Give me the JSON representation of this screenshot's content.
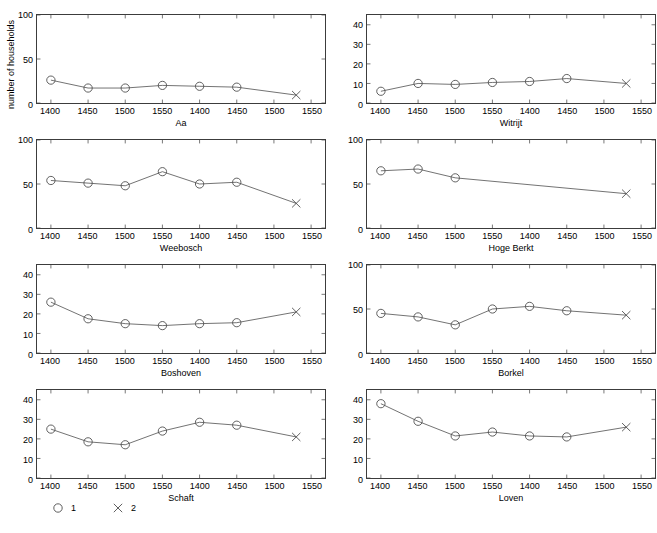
{
  "figure": {
    "ylabel": "number of households",
    "caption_partial": ""
  },
  "legend": {
    "position": "bottom-left",
    "entries": [
      {
        "label": "1",
        "marker": "circle",
        "marker_icon": "circle-marker-icon"
      },
      {
        "label": "2",
        "marker": "cross",
        "marker_icon": "cross-marker-icon"
      }
    ]
  },
  "colors": {
    "line": "#4d4d4d",
    "marker": "#4d4d4d",
    "axis": "#3c3c3c",
    "text": "#000000",
    "background": "#ffffff"
  },
  "chart_data": {
    "type": "line",
    "title": "",
    "xlabel": "",
    "ylabel": "number of households",
    "grid": false,
    "legend_position": "bottom-left",
    "shared_x": [
      1400,
      1450,
      1500,
      1550,
      1400,
      1450,
      1500,
      1550
    ],
    "x_tick_labels": [
      "1400",
      "1450",
      "1500",
      "1550",
      "1400",
      "1450",
      "1500",
      "1550"
    ],
    "xlim": [
      1390,
      1560
    ],
    "marker_legend": {
      "1": "circle (series 1)",
      "2": "cross (series 2)"
    },
    "panels": [
      {
        "name": "Aa",
        "row": 0,
        "col": 0,
        "ylim": [
          0,
          100
        ],
        "y_ticks": [
          0,
          50,
          100
        ],
        "y_tick_labels": [
          "0",
          "50",
          "100"
        ],
        "series": [
          {
            "name": "1",
            "marker": "circle",
            "x": [
              1400,
              1450,
              1500,
              1550,
              1400,
              1450
            ],
            "x_slots": [
              0,
              1,
              2,
              3,
              4,
              5
            ],
            "values": [
              26,
              17,
              17,
              20,
              19,
              18
            ]
          },
          {
            "name": "2",
            "marker": "cross",
            "x": [
              1530
            ],
            "x_slots": [
              6.6
            ],
            "values": [
              9
            ]
          }
        ]
      },
      {
        "name": "Witrijt",
        "row": 0,
        "col": 1,
        "ylim": [
          0,
          45
        ],
        "y_ticks": [
          0,
          10,
          20,
          30,
          40
        ],
        "y_tick_labels": [
          "0",
          "10",
          "20",
          "30",
          "40"
        ],
        "series": [
          {
            "name": "1",
            "marker": "circle",
            "x": [
              1400,
              1450,
              1500,
              1550,
              1400,
              1450
            ],
            "x_slots": [
              0,
              1,
              2,
              3,
              4,
              5
            ],
            "values": [
              6,
              10,
              9.5,
              10.5,
              11,
              12.5
            ]
          },
          {
            "name": "2",
            "marker": "cross",
            "x": [
              1530
            ],
            "x_slots": [
              6.6
            ],
            "values": [
              10
            ]
          }
        ]
      },
      {
        "name": "Weebosch",
        "row": 1,
        "col": 0,
        "ylim": [
          0,
          100
        ],
        "y_ticks": [
          0,
          50,
          100
        ],
        "y_tick_labels": [
          "0",
          "50",
          "100"
        ],
        "series": [
          {
            "name": "1",
            "marker": "circle",
            "x": [
              1400,
              1450,
              1500,
              1550,
              1400,
              1450
            ],
            "x_slots": [
              0,
              1,
              2,
              3,
              4,
              5
            ],
            "values": [
              54,
              51,
              48,
              64,
              50,
              52
            ]
          },
          {
            "name": "2",
            "marker": "cross",
            "x": [
              1530
            ],
            "x_slots": [
              6.6
            ],
            "values": [
              28
            ]
          }
        ]
      },
      {
        "name": "Hoge Berkt",
        "row": 1,
        "col": 1,
        "ylim": [
          0,
          100
        ],
        "y_ticks": [
          0,
          50,
          100
        ],
        "y_tick_labels": [
          "0",
          "50",
          "100"
        ],
        "series": [
          {
            "name": "1",
            "marker": "circle",
            "x": [
              1400,
              1450,
              1500
            ],
            "x_slots": [
              0,
              1,
              2
            ],
            "values": [
              65,
              67,
              57
            ]
          },
          {
            "name": "2",
            "marker": "cross",
            "x": [
              1530
            ],
            "x_slots": [
              6.6
            ],
            "values": [
              39
            ]
          }
        ]
      },
      {
        "name": "Boshoven",
        "row": 2,
        "col": 0,
        "ylim": [
          0,
          45
        ],
        "y_ticks": [
          0,
          10,
          20,
          30,
          40
        ],
        "y_tick_labels": [
          "0",
          "10",
          "20",
          "30",
          "40"
        ],
        "series": [
          {
            "name": "1",
            "marker": "circle",
            "x": [
              1400,
              1450,
              1500,
              1550,
              1400,
              1450
            ],
            "x_slots": [
              0,
              1,
              2,
              3,
              4,
              5
            ],
            "values": [
              26,
              17.5,
              15,
              14,
              15,
              15.5
            ]
          },
          {
            "name": "2",
            "marker": "cross",
            "x": [
              1530
            ],
            "x_slots": [
              6.6
            ],
            "values": [
              21
            ]
          }
        ]
      },
      {
        "name": "Borkel",
        "row": 2,
        "col": 1,
        "ylim": [
          0,
          100
        ],
        "y_ticks": [
          0,
          50,
          100
        ],
        "y_tick_labels": [
          "0",
          "50",
          "100"
        ],
        "series": [
          {
            "name": "1",
            "marker": "circle",
            "x": [
              1400,
              1450,
              1500,
              1550,
              1400,
              1450
            ],
            "x_slots": [
              0,
              1,
              2,
              3,
              4,
              5
            ],
            "values": [
              45,
              41,
              32,
              50,
              53,
              48
            ]
          },
          {
            "name": "2",
            "marker": "cross",
            "x": [
              1530
            ],
            "x_slots": [
              6.6
            ],
            "values": [
              43
            ]
          }
        ]
      },
      {
        "name": "Schaft",
        "row": 3,
        "col": 0,
        "ylim": [
          0,
          45
        ],
        "y_ticks": [
          0,
          10,
          20,
          30,
          40
        ],
        "y_tick_labels": [
          "0",
          "10",
          "20",
          "30",
          "40"
        ],
        "series": [
          {
            "name": "1",
            "marker": "circle",
            "x": [
              1400,
              1450,
              1500,
              1550,
              1400,
              1450
            ],
            "x_slots": [
              0,
              1,
              2,
              3,
              4,
              5
            ],
            "values": [
              25,
              18.5,
              17,
              24,
              28.5,
              27
            ]
          },
          {
            "name": "2",
            "marker": "cross",
            "x": [
              1530
            ],
            "x_slots": [
              6.6
            ],
            "values": [
              21
            ]
          }
        ]
      },
      {
        "name": "Loven",
        "row": 3,
        "col": 1,
        "ylim": [
          0,
          45
        ],
        "y_ticks": [
          0,
          10,
          20,
          30,
          40
        ],
        "y_tick_labels": [
          "0",
          "10",
          "20",
          "30",
          "40"
        ],
        "series": [
          {
            "name": "1",
            "marker": "circle",
            "x": [
              1400,
              1450,
              1500,
              1550,
              1400,
              1450
            ],
            "x_slots": [
              0,
              1,
              2,
              3,
              4,
              5
            ],
            "values": [
              38,
              29,
              21.5,
              23.5,
              21.5,
              21
            ]
          },
          {
            "name": "2",
            "marker": "cross",
            "x": [
              1530
            ],
            "x_slots": [
              6.6
            ],
            "values": [
              26
            ]
          }
        ]
      }
    ]
  }
}
